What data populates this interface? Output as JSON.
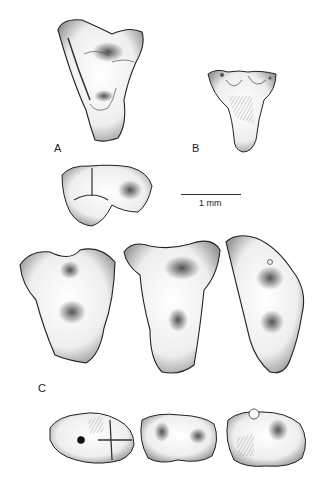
{
  "figure": {
    "panels": [
      {
        "id": "A",
        "label": "A",
        "description": "upper molar, occlusal view"
      },
      {
        "id": "B",
        "label": "B",
        "description": "small upper tooth, occlusal view"
      },
      {
        "id": "C",
        "label": "C",
        "description": "three molars in occlusal view with three lower teeth in lateral/occlusal view"
      }
    ],
    "scale_bar": {
      "label": "1 mm"
    },
    "colors": {
      "ink": "#222222",
      "background": "#ffffff"
    }
  }
}
